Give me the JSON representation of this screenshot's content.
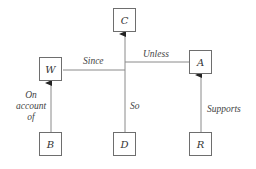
{
  "diagram": {
    "type": "Toulmin argument model",
    "nodes": {
      "C": {
        "label": "C"
      },
      "W": {
        "label": "W"
      },
      "A": {
        "label": "A"
      },
      "B": {
        "label": "B"
      },
      "D": {
        "label": "D"
      },
      "R": {
        "label": "R"
      }
    },
    "edges": {
      "since": {
        "label": "Since",
        "from": "W",
        "to": "D-C line"
      },
      "unless": {
        "label": "Unless",
        "from": "A",
        "to": "D-C line"
      },
      "so": {
        "label": "So",
        "from": "D",
        "to": "C"
      },
      "on_account_of": {
        "label_lines": [
          "On",
          "account",
          "of"
        ],
        "from": "B",
        "to": "W"
      },
      "supports": {
        "label": "Supports",
        "from": "R",
        "to": "A"
      }
    },
    "colors": {
      "line": "#7a7a7a",
      "text": "#333333"
    }
  }
}
